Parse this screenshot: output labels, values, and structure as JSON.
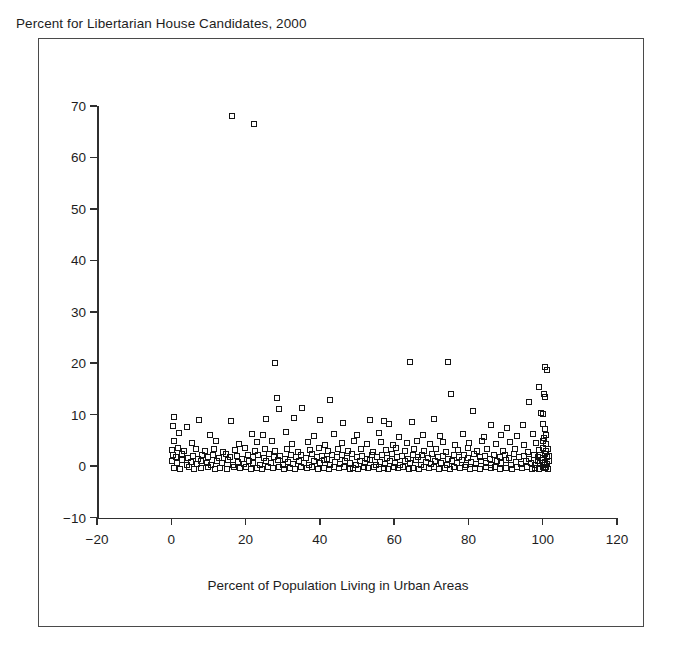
{
  "chart_data": {
    "type": "scatter",
    "title": "Percent for Libertarian House Candidates, 2000",
    "xlabel": "Percent of Population Living in Urban Areas",
    "ylabel": "",
    "xlim": [
      -20,
      120
    ],
    "ylim": [
      -10,
      70
    ],
    "xticks": [
      -20,
      0,
      20,
      40,
      60,
      80,
      100,
      120
    ],
    "xtick_labels": [
      "−20",
      "0",
      "20",
      "40",
      "60",
      "80",
      "100",
      "120"
    ],
    "yticks": [
      -10,
      0,
      10,
      20,
      30,
      40,
      50,
      60,
      70
    ],
    "ytick_labels": [
      "−10",
      "0",
      "10",
      "20",
      "30",
      "40",
      "50",
      "60",
      "70"
    ],
    "grid": false,
    "legend": false,
    "marker": "open-square",
    "marker_color": "#141414",
    "points": [
      [
        16.3,
        68.0
      ],
      [
        22.2,
        66.5
      ],
      [
        27.8,
        20.1
      ],
      [
        64.2,
        20.3
      ],
      [
        74.6,
        20.2
      ],
      [
        100.5,
        19.3
      ],
      [
        101.2,
        18.6
      ],
      [
        98.9,
        15.4
      ],
      [
        100.3,
        14.0
      ],
      [
        75.2,
        14.1
      ],
      [
        100.6,
        13.4
      ],
      [
        28.4,
        13.2
      ],
      [
        42.6,
        12.9
      ],
      [
        96.4,
        12.4
      ],
      [
        29.1,
        11.0
      ],
      [
        35.2,
        11.2
      ],
      [
        81.3,
        10.8
      ],
      [
        99.6,
        10.4
      ],
      [
        100.2,
        10.1
      ],
      [
        0.6,
        9.6
      ],
      [
        7.5,
        8.9
      ],
      [
        16.0,
        8.7
      ],
      [
        25.5,
        9.2
      ],
      [
        33.0,
        9.4
      ],
      [
        40.1,
        8.9
      ],
      [
        46.2,
        8.3
      ],
      [
        53.4,
        9.0
      ],
      [
        57.2,
        8.7
      ],
      [
        58.6,
        8.2
      ],
      [
        64.9,
        8.6
      ],
      [
        70.8,
        9.2
      ],
      [
        0.4,
        7.8
      ],
      [
        4.1,
        7.6
      ],
      [
        86.1,
        8.0
      ],
      [
        90.4,
        7.4
      ],
      [
        94.8,
        7.9
      ],
      [
        100.1,
        8.2
      ],
      [
        100.7,
        7.3
      ],
      [
        2.2,
        6.4
      ],
      [
        10.3,
        6.1
      ],
      [
        21.7,
        6.3
      ],
      [
        24.6,
        6.0
      ],
      [
        30.9,
        6.6
      ],
      [
        38.5,
        5.8
      ],
      [
        43.7,
        6.2
      ],
      [
        50.1,
        6.0
      ],
      [
        55.8,
        6.4
      ],
      [
        61.3,
        5.7
      ],
      [
        67.9,
        6.1
      ],
      [
        72.4,
        5.9
      ],
      [
        78.6,
        6.3
      ],
      [
        84.2,
        5.6
      ],
      [
        88.9,
        6.0
      ],
      [
        93.1,
        5.8
      ],
      [
        97.5,
        6.2
      ],
      [
        100.4,
        5.4
      ],
      [
        101.0,
        6.0
      ],
      [
        0.8,
        4.9
      ],
      [
        5.6,
        4.5
      ],
      [
        12.1,
        4.8
      ],
      [
        18.3,
        4.2
      ],
      [
        23.1,
        4.6
      ],
      [
        27.2,
        4.9
      ],
      [
        32.4,
        4.3
      ],
      [
        36.8,
        4.7
      ],
      [
        41.5,
        4.1
      ],
      [
        45.9,
        4.5
      ],
      [
        49.3,
        4.8
      ],
      [
        52.7,
        4.2
      ],
      [
        56.4,
        4.6
      ],
      [
        59.8,
        4.0
      ],
      [
        63.5,
        4.4
      ],
      [
        66.2,
        4.8
      ],
      [
        69.7,
        4.2
      ],
      [
        73.1,
        4.6
      ],
      [
        76.5,
        4.0
      ],
      [
        80.2,
        4.4
      ],
      [
        83.6,
        4.9
      ],
      [
        87.4,
        4.3
      ],
      [
        91.2,
        4.7
      ],
      [
        95.0,
        4.1
      ],
      [
        98.3,
        4.5
      ],
      [
        100.0,
        4.8
      ],
      [
        100.8,
        4.2
      ],
      [
        0.3,
        3.2
      ],
      [
        1.9,
        3.6
      ],
      [
        3.4,
        3.0
      ],
      [
        6.7,
        3.4
      ],
      [
        9.2,
        2.9
      ],
      [
        11.6,
        3.3
      ],
      [
        14.0,
        2.8
      ],
      [
        17.2,
        3.2
      ],
      [
        19.8,
        3.6
      ],
      [
        22.5,
        3.0
      ],
      [
        25.1,
        3.4
      ],
      [
        28.0,
        2.9
      ],
      [
        31.2,
        3.3
      ],
      [
        34.1,
        2.8
      ],
      [
        37.3,
        3.2
      ],
      [
        39.9,
        3.6
      ],
      [
        42.2,
        3.0
      ],
      [
        44.8,
        3.4
      ],
      [
        47.5,
        2.9
      ],
      [
        51.0,
        3.3
      ],
      [
        54.2,
        2.8
      ],
      [
        57.9,
        3.2
      ],
      [
        60.5,
        3.6
      ],
      [
        62.8,
        3.0
      ],
      [
        65.4,
        3.4
      ],
      [
        68.1,
        2.9
      ],
      [
        71.3,
        3.3
      ],
      [
        74.0,
        2.8
      ],
      [
        77.2,
        3.2
      ],
      [
        79.8,
        3.6
      ],
      [
        82.4,
        3.0
      ],
      [
        85.1,
        3.4
      ],
      [
        89.3,
        2.9
      ],
      [
        92.6,
        3.3
      ],
      [
        96.1,
        2.8
      ],
      [
        99.0,
        3.2
      ],
      [
        100.2,
        3.6
      ],
      [
        100.9,
        3.0
      ],
      [
        101.4,
        3.4
      ],
      [
        0.5,
        2.1
      ],
      [
        1.2,
        1.8
      ],
      [
        2.8,
        2.3
      ],
      [
        4.6,
        1.6
      ],
      [
        5.9,
        2.0
      ],
      [
        7.1,
        1.4
      ],
      [
        8.4,
        2.2
      ],
      [
        10.0,
        1.7
      ],
      [
        11.2,
        2.1
      ],
      [
        12.9,
        1.5
      ],
      [
        14.6,
        2.3
      ],
      [
        15.9,
        1.8
      ],
      [
        17.8,
        2.0
      ],
      [
        19.1,
        1.4
      ],
      [
        20.6,
        2.2
      ],
      [
        21.9,
        1.7
      ],
      [
        23.4,
        2.1
      ],
      [
        24.9,
        1.5
      ],
      [
        26.3,
        2.3
      ],
      [
        27.6,
        1.8
      ],
      [
        29.4,
        2.0
      ],
      [
        30.7,
        1.4
      ],
      [
        32.1,
        2.2
      ],
      [
        33.6,
        1.7
      ],
      [
        35.0,
        2.1
      ],
      [
        36.2,
        1.5
      ],
      [
        37.8,
        2.3
      ],
      [
        39.1,
        1.8
      ],
      [
        40.6,
        2.0
      ],
      [
        41.9,
        1.4
      ],
      [
        43.2,
        2.2
      ],
      [
        44.5,
        1.7
      ],
      [
        46.0,
        2.1
      ],
      [
        47.2,
        1.5
      ],
      [
        48.6,
        2.3
      ],
      [
        49.9,
        1.8
      ],
      [
        51.4,
        2.0
      ],
      [
        52.8,
        1.4
      ],
      [
        54.0,
        2.2
      ],
      [
        55.3,
        1.7
      ],
      [
        56.8,
        2.1
      ],
      [
        58.1,
        1.5
      ],
      [
        59.4,
        2.3
      ],
      [
        60.9,
        1.8
      ],
      [
        62.2,
        2.0
      ],
      [
        63.6,
        1.4
      ],
      [
        65.0,
        2.2
      ],
      [
        66.4,
        1.7
      ],
      [
        67.6,
        2.1
      ],
      [
        69.0,
        1.5
      ],
      [
        70.3,
        2.3
      ],
      [
        71.8,
        1.8
      ],
      [
        73.2,
        2.0
      ],
      [
        74.5,
        1.4
      ],
      [
        76.0,
        2.2
      ],
      [
        77.4,
        1.7
      ],
      [
        78.8,
        2.1
      ],
      [
        80.0,
        1.5
      ],
      [
        81.6,
        2.3
      ],
      [
        83.0,
        1.8
      ],
      [
        84.4,
        2.0
      ],
      [
        85.8,
        1.4
      ],
      [
        87.0,
        2.2
      ],
      [
        88.4,
        1.7
      ],
      [
        89.8,
        2.1
      ],
      [
        91.0,
        1.5
      ],
      [
        92.2,
        2.3
      ],
      [
        93.6,
        1.8
      ],
      [
        94.9,
        2.0
      ],
      [
        96.3,
        1.4
      ],
      [
        97.6,
        2.2
      ],
      [
        98.8,
        1.7
      ],
      [
        99.4,
        2.1
      ],
      [
        100.1,
        1.5
      ],
      [
        100.6,
        2.3
      ],
      [
        101.1,
        1.8
      ],
      [
        101.6,
        2.0
      ],
      [
        0.2,
        0.9
      ],
      [
        1.6,
        0.5
      ],
      [
        3.0,
        1.1
      ],
      [
        4.2,
        0.3
      ],
      [
        5.4,
        0.8
      ],
      [
        6.8,
        0.4
      ],
      [
        8.0,
        1.0
      ],
      [
        9.6,
        0.6
      ],
      [
        10.8,
        0.2
      ],
      [
        12.4,
        0.9
      ],
      [
        13.6,
        0.5
      ],
      [
        15.2,
        1.1
      ],
      [
        16.6,
        0.3
      ],
      [
        18.0,
        0.8
      ],
      [
        19.5,
        0.4
      ],
      [
        20.9,
        1.0
      ],
      [
        22.1,
        0.6
      ],
      [
        23.8,
        0.2
      ],
      [
        25.6,
        0.9
      ],
      [
        26.9,
        0.5
      ],
      [
        28.6,
        1.1
      ],
      [
        30.0,
        0.3
      ],
      [
        31.5,
        0.8
      ],
      [
        32.8,
        0.4
      ],
      [
        34.4,
        1.0
      ],
      [
        35.7,
        0.6
      ],
      [
        37.0,
        0.2
      ],
      [
        38.4,
        0.9
      ],
      [
        40.0,
        0.5
      ],
      [
        41.2,
        1.1
      ],
      [
        42.8,
        0.3
      ],
      [
        44.0,
        0.8
      ],
      [
        45.4,
        0.4
      ],
      [
        46.8,
        1.0
      ],
      [
        48.2,
        0.6
      ],
      [
        49.6,
        0.2
      ],
      [
        50.8,
        0.9
      ],
      [
        52.2,
        0.5
      ],
      [
        53.5,
        1.1
      ],
      [
        55.0,
        0.3
      ],
      [
        56.2,
        0.8
      ],
      [
        57.5,
        0.4
      ],
      [
        58.9,
        1.0
      ],
      [
        60.2,
        0.6
      ],
      [
        61.6,
        0.2
      ],
      [
        63.0,
        0.9
      ],
      [
        64.4,
        0.5
      ],
      [
        65.8,
        1.1
      ],
      [
        67.1,
        0.3
      ],
      [
        68.5,
        0.8
      ],
      [
        69.8,
        0.4
      ],
      [
        71.0,
        1.0
      ],
      [
        72.6,
        0.6
      ],
      [
        74.2,
        0.2
      ],
      [
        75.5,
        0.9
      ],
      [
        76.8,
        0.5
      ],
      [
        78.2,
        1.1
      ],
      [
        79.4,
        0.3
      ],
      [
        80.8,
        0.8
      ],
      [
        82.0,
        0.4
      ],
      [
        83.4,
        1.0
      ],
      [
        84.8,
        0.6
      ],
      [
        86.2,
        0.2
      ],
      [
        87.6,
        0.9
      ],
      [
        88.9,
        0.5
      ],
      [
        90.2,
        1.1
      ],
      [
        91.5,
        0.3
      ],
      [
        92.9,
        0.8
      ],
      [
        94.2,
        0.4
      ],
      [
        95.5,
        1.0
      ],
      [
        96.8,
        0.6
      ],
      [
        97.9,
        0.2
      ],
      [
        98.6,
        0.9
      ],
      [
        99.2,
        0.5
      ],
      [
        99.8,
        1.1
      ],
      [
        100.3,
        0.3
      ],
      [
        100.7,
        0.8
      ],
      [
        101.2,
        0.4
      ],
      [
        101.8,
        1.0
      ],
      [
        0.7,
        -0.3
      ],
      [
        2.4,
        -0.5
      ],
      [
        4.8,
        -0.2
      ],
      [
        6.2,
        -0.6
      ],
      [
        7.9,
        -0.4
      ],
      [
        9.9,
        -0.1
      ],
      [
        11.9,
        -0.5
      ],
      [
        13.1,
        -0.3
      ],
      [
        14.9,
        -0.6
      ],
      [
        16.9,
        -0.2
      ],
      [
        18.6,
        -0.4
      ],
      [
        20.2,
        -0.1
      ],
      [
        21.4,
        -0.5
      ],
      [
        23.0,
        -0.3
      ],
      [
        24.3,
        -0.6
      ],
      [
        26.0,
        -0.2
      ],
      [
        27.3,
        -0.4
      ],
      [
        29.0,
        -0.1
      ],
      [
        30.4,
        -0.5
      ],
      [
        31.9,
        -0.3
      ],
      [
        33.3,
        -0.6
      ],
      [
        34.8,
        -0.2
      ],
      [
        36.5,
        -0.4
      ],
      [
        38.0,
        -0.1
      ],
      [
        39.5,
        -0.5
      ],
      [
        41.0,
        -0.3
      ],
      [
        42.5,
        -0.6
      ],
      [
        43.9,
        -0.2
      ],
      [
        45.2,
        -0.4
      ],
      [
        46.5,
        -0.1
      ],
      [
        48.0,
        -0.5
      ],
      [
        49.0,
        -0.3
      ],
      [
        50.4,
        -0.6
      ],
      [
        51.8,
        -0.2
      ],
      [
        53.0,
        -0.4
      ],
      [
        54.6,
        -0.1
      ],
      [
        56.0,
        -0.5
      ],
      [
        57.2,
        -0.3
      ],
      [
        58.4,
        -0.6
      ],
      [
        59.9,
        -0.2
      ],
      [
        61.1,
        -0.4
      ],
      [
        62.5,
        -0.1
      ],
      [
        64.0,
        -0.5
      ],
      [
        65.2,
        -0.3
      ],
      [
        66.8,
        -0.6
      ],
      [
        68.0,
        -0.2
      ],
      [
        69.4,
        -0.4
      ],
      [
        70.6,
        -0.1
      ],
      [
        72.0,
        -0.5
      ],
      [
        73.6,
        -0.3
      ],
      [
        75.0,
        -0.6
      ],
      [
        76.2,
        -0.2
      ],
      [
        77.8,
        -0.4
      ],
      [
        79.0,
        -0.1
      ],
      [
        80.4,
        -0.5
      ],
      [
        81.9,
        -0.3
      ],
      [
        83.2,
        -0.6
      ],
      [
        84.6,
        -0.2
      ],
      [
        86.0,
        -0.4
      ],
      [
        87.2,
        -0.1
      ],
      [
        88.6,
        -0.5
      ],
      [
        90.0,
        -0.3
      ],
      [
        91.8,
        -0.6
      ],
      [
        93.0,
        -0.2
      ],
      [
        94.5,
        -0.4
      ],
      [
        95.8,
        -0.1
      ],
      [
        97.0,
        -0.5
      ],
      [
        98.0,
        -0.3
      ],
      [
        99.0,
        -0.6
      ],
      [
        100.0,
        -0.2
      ],
      [
        100.5,
        -0.4
      ],
      [
        101.0,
        -0.1
      ],
      [
        101.5,
        -0.5
      ]
    ]
  }
}
